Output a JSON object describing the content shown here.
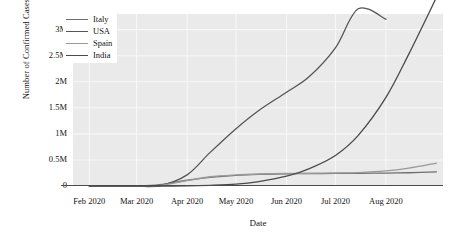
{
  "chart_data": {
    "type": "line",
    "title": "",
    "xlabel": "Date",
    "ylabel": "Number of Confirmed Cases",
    "grid": true,
    "legend_position": "top-left",
    "x_tick_labels": [
      "Feb 2020",
      "Mar 2020",
      "Apr 2020",
      "May 2020",
      "Jun 2020",
      "Jul 2020",
      "Aug 2020"
    ],
    "y_tick_labels": [
      "0",
      "0.5M",
      "1M",
      "1.5M",
      "2M",
      "2.5M",
      "3M"
    ],
    "y_tick_values": [
      0,
      500000,
      1000000,
      1500000,
      2000000,
      2500000,
      3000000
    ],
    "ylim": [
      0,
      3300000
    ],
    "xlim": [
      "2020-01-22",
      "2020-09-05"
    ],
    "series": [
      {
        "name": "Italy",
        "color": "#6e6e6e",
        "x": [
          "2020-02-01",
          "2020-02-15",
          "2020-03-01",
          "2020-03-15",
          "2020-04-01",
          "2020-04-15",
          "2020-05-01",
          "2020-05-15",
          "2020-06-01",
          "2020-06-15",
          "2020-07-01",
          "2020-07-15",
          "2020-08-01",
          "2020-08-15",
          "2020-09-01"
        ],
        "values": [
          0,
          0,
          1700,
          24700,
          110500,
          165200,
          205500,
          223100,
          233000,
          237300,
          240600,
          243500,
          247500,
          253900,
          269200
        ]
      },
      {
        "name": "USA",
        "color": "#555555",
        "x": [
          "2020-02-01",
          "2020-02-15",
          "2020-03-01",
          "2020-03-15",
          "2020-04-01",
          "2020-04-15",
          "2020-05-01",
          "2020-05-15",
          "2020-06-01",
          "2020-06-15",
          "2020-07-01",
          "2020-07-15",
          "2020-08-01"
        ],
        "values": [
          8,
          15,
          75,
          3500,
          213000,
          640000,
          1100000,
          1450000,
          1800000,
          2100000,
          2650000,
          3400000,
          3200000
        ]
      },
      {
        "name": "Spain",
        "color": "#9a9a9a",
        "x": [
          "2020-02-01",
          "2020-02-15",
          "2020-03-01",
          "2020-03-15",
          "2020-04-01",
          "2020-04-15",
          "2020-05-01",
          "2020-05-15",
          "2020-06-01",
          "2020-06-15",
          "2020-07-01",
          "2020-07-15",
          "2020-08-01",
          "2020-08-15",
          "2020-09-01"
        ],
        "values": [
          0,
          0,
          100,
          7800,
          104000,
          177600,
          213000,
          230000,
          239600,
          244300,
          249300,
          258000,
          288500,
          342900,
          440000
        ]
      },
      {
        "name": "India",
        "color": "#4a4a4a",
        "x": [
          "2020-02-01",
          "2020-02-15",
          "2020-03-01",
          "2020-03-15",
          "2020-04-01",
          "2020-04-15",
          "2020-05-01",
          "2020-05-15",
          "2020-06-01",
          "2020-06-15",
          "2020-07-01",
          "2020-07-15",
          "2020-08-01",
          "2020-08-15",
          "2020-09-01"
        ],
        "values": [
          1,
          3,
          3,
          110,
          1990,
          12400,
          35000,
          85900,
          190600,
          333000,
          585000,
          970000,
          1700000,
          2530000,
          3620000
        ]
      }
    ]
  },
  "axes": {
    "ylabel": "Number of Confirmed Cases",
    "xlabel": "Date"
  },
  "legend": {
    "items": [
      {
        "label": "Italy",
        "color": "#6e6e6e"
      },
      {
        "label": "USA",
        "color": "#555555"
      },
      {
        "label": "Spain",
        "color": "#9a9a9a"
      },
      {
        "label": "India",
        "color": "#4a4a4a"
      }
    ]
  },
  "style": {
    "panel_background": "#eaeaea",
    "grid_color": "#f7f7f7",
    "axis_color": "#4b4b4b",
    "text_color": "#141414"
  }
}
